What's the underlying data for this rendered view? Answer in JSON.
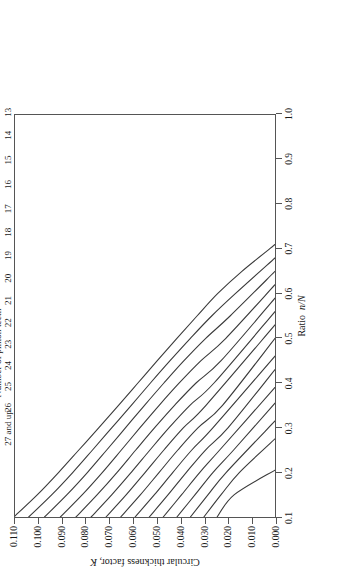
{
  "figure": {
    "rotation_note": "printed-landscape",
    "background_color": "#ffffff",
    "line_color": "#3a3a3a",
    "axis_color": "#555555"
  },
  "chart_data": {
    "type": "line",
    "title": "",
    "xlabel": "Ratio n/N",
    "ylabel": "Circular thickness factor, K",
    "legend_title": "Number of pinion teeth",
    "legend_position": "curve-end-labels-top",
    "grid": false,
    "xlim": [
      0.1,
      1.0
    ],
    "ylim": [
      0.0,
      0.11
    ],
    "xticks": [
      "0.1",
      "0.2",
      "0.3",
      "0.4",
      "0.5",
      "0.6",
      "0.7",
      "0.8",
      "0.9",
      "1.0"
    ],
    "xtick_values": [
      0.1,
      0.2,
      0.3,
      0.4,
      0.5,
      0.6,
      0.7,
      0.8,
      0.9,
      1.0
    ],
    "yticks": [
      "0.000",
      "0.010",
      "0.020",
      "0.030",
      "0.040",
      "0.050",
      "0.060",
      "0.070",
      "0.080",
      "0.090",
      "0.100",
      "0.110"
    ],
    "ytick_values": [
      0.0,
      0.01,
      0.02,
      0.03,
      0.04,
      0.05,
      0.06,
      0.07,
      0.08,
      0.09,
      0.1,
      0.11
    ],
    "series": [
      {
        "name": "13",
        "label": "13",
        "x": [
          0.1,
          0.15,
          0.2,
          0.25,
          0.3,
          0.35,
          0.4,
          0.45,
          0.5,
          0.55,
          0.6,
          0.65,
          0.71
        ],
        "values": [
          0.1105,
          0.1005,
          0.0915,
          0.083,
          0.0745,
          0.0662,
          0.058,
          0.0498,
          0.0415,
          0.033,
          0.0243,
          0.014,
          0.0
        ]
      },
      {
        "name": "14",
        "label": "14",
        "x": [
          0.1,
          0.15,
          0.2,
          0.25,
          0.3,
          0.35,
          0.4,
          0.45,
          0.5,
          0.55,
          0.6,
          0.68
        ],
        "values": [
          0.1042,
          0.0944,
          0.0855,
          0.0772,
          0.069,
          0.0608,
          0.0527,
          0.0444,
          0.0358,
          0.0268,
          0.0168,
          0.0
        ]
      },
      {
        "name": "15",
        "label": "15",
        "x": [
          0.1,
          0.15,
          0.2,
          0.25,
          0.3,
          0.35,
          0.4,
          0.45,
          0.5,
          0.55,
          0.65
        ],
        "values": [
          0.0975,
          0.088,
          0.0793,
          0.0712,
          0.0632,
          0.0552,
          0.047,
          0.0385,
          0.0293,
          0.019,
          0.0
        ]
      },
      {
        "name": "16",
        "label": "16",
        "x": [
          0.1,
          0.15,
          0.2,
          0.25,
          0.3,
          0.35,
          0.4,
          0.45,
          0.5,
          0.62
        ],
        "values": [
          0.0908,
          0.0815,
          0.073,
          0.065,
          0.0571,
          0.049,
          0.0405,
          0.0313,
          0.0208,
          0.0
        ]
      },
      {
        "name": "17",
        "label": "17",
        "x": [
          0.1,
          0.15,
          0.2,
          0.25,
          0.3,
          0.35,
          0.4,
          0.45,
          0.59
        ],
        "values": [
          0.0842,
          0.0752,
          0.0668,
          0.0589,
          0.0509,
          0.0425,
          0.0334,
          0.0228,
          0.0
        ]
      },
      {
        "name": "18",
        "label": "18",
        "x": [
          0.1,
          0.15,
          0.2,
          0.25,
          0.3,
          0.35,
          0.4,
          0.56
        ],
        "values": [
          0.0778,
          0.069,
          0.0608,
          0.0529,
          0.0448,
          0.036,
          0.0258,
          0.0
        ]
      },
      {
        "name": "19",
        "label": "19",
        "x": [
          0.1,
          0.15,
          0.2,
          0.25,
          0.3,
          0.35,
          0.53
        ],
        "values": [
          0.0715,
          0.0629,
          0.0549,
          0.047,
          0.0387,
          0.0292,
          0.0
        ]
      },
      {
        "name": "20",
        "label": "20",
        "x": [
          0.1,
          0.15,
          0.2,
          0.25,
          0.3,
          0.35,
          0.5
        ],
        "values": [
          0.0653,
          0.0569,
          0.049,
          0.0411,
          0.0325,
          0.0222,
          0.0
        ]
      },
      {
        "name": "21",
        "label": "21",
        "x": [
          0.1,
          0.15,
          0.2,
          0.25,
          0.3,
          0.46
        ],
        "values": [
          0.0592,
          0.051,
          0.0432,
          0.0352,
          0.0262,
          0.0
        ]
      },
      {
        "name": "22",
        "label": "22",
        "x": [
          0.1,
          0.15,
          0.2,
          0.25,
          0.3,
          0.43
        ],
        "values": [
          0.0532,
          0.0452,
          0.0375,
          0.0294,
          0.0198,
          0.0
        ]
      },
      {
        "name": "23",
        "label": "23",
        "x": [
          0.1,
          0.15,
          0.2,
          0.25,
          0.39
        ],
        "values": [
          0.0473,
          0.0395,
          0.0318,
          0.0234,
          0.0
        ]
      },
      {
        "name": "24",
        "label": "24",
        "x": [
          0.1,
          0.15,
          0.2,
          0.25,
          0.355
        ],
        "values": [
          0.0415,
          0.0338,
          0.0262,
          0.0175,
          0.0
        ]
      },
      {
        "name": "25",
        "label": "25",
        "x": [
          0.1,
          0.15,
          0.2,
          0.315
        ],
        "values": [
          0.0358,
          0.0283,
          0.0206,
          0.0
        ]
      },
      {
        "name": "26",
        "label": "26",
        "x": [
          0.1,
          0.15,
          0.2,
          0.275
        ],
        "values": [
          0.0301,
          0.0228,
          0.015,
          0.0
        ]
      },
      {
        "name": "27",
        "label": "27 and up",
        "x": [
          0.1,
          0.15,
          0.205
        ],
        "values": [
          0.0245,
          0.0172,
          0.0
        ]
      }
    ]
  }
}
